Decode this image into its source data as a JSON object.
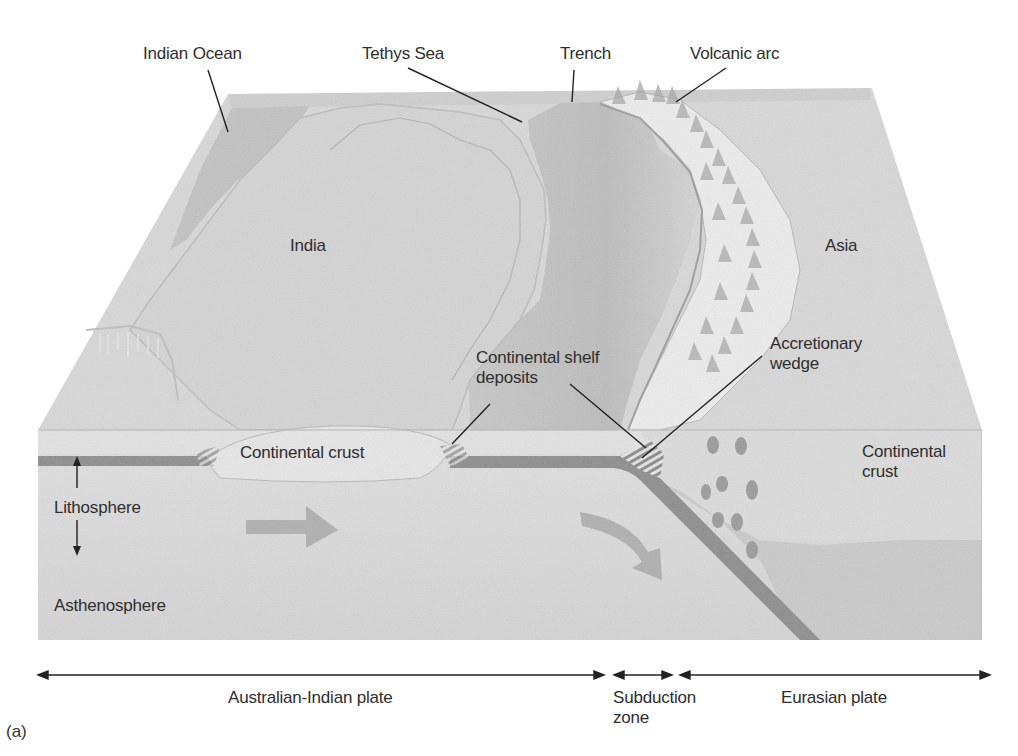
{
  "figure": {
    "panel_label": "(a)",
    "surface_labels": {
      "indian_ocean": "Indian Ocean",
      "tethys_sea": "Tethys Sea",
      "trench": "Trench",
      "volcanic_arc": "Volcanic arc",
      "india": "India",
      "asia": "Asia",
      "continental_shelf_deposits": "Continental shelf\ndeposits",
      "accretionary_wedge": "Accretionary\nwedge"
    },
    "section_labels": {
      "continental_crust_india": "Continental crust",
      "continental_crust_asia": "Continental\ncrust",
      "lithosphere": "Lithosphere",
      "asthenosphere": "Asthenosphere"
    },
    "plate_extents": [
      {
        "label": "Australian-Indian plate",
        "from_x": 38,
        "to_x": 604
      },
      {
        "label": "Subduction\nzone",
        "from_x": 614,
        "to_x": 672
      },
      {
        "label": "Eurasian plate",
        "from_x": 680,
        "to_x": 990
      }
    ],
    "colors": {
      "background": "#ffffff",
      "land_surface": "#d9d9d9",
      "sea": "#c2c2c2",
      "block_side": "#dcdcdc",
      "lithosphere_band": "#8e8e8e",
      "arrow_fill": "#a9a9a9",
      "leader_line": "#222222",
      "text": "#2e2e2e"
    }
  }
}
